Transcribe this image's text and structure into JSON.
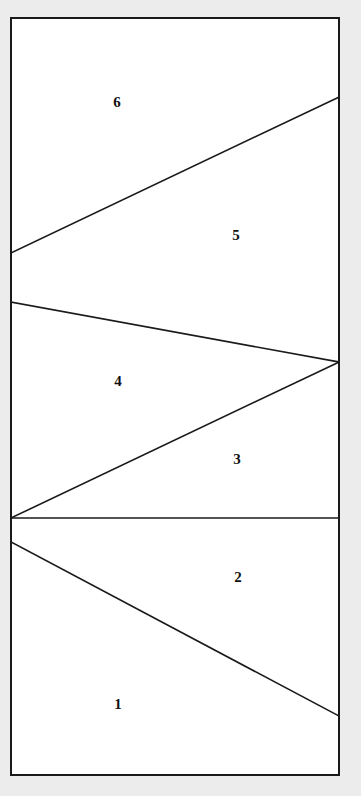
{
  "figure": {
    "name": "partitioned-rectangle",
    "background_color": "#ececec",
    "canvas": {
      "width": 361,
      "height": 796
    }
  },
  "frame": {
    "name": "outer-rectangle",
    "x": 11,
    "y": 18,
    "width": 328,
    "height": 757,
    "stroke_color": "#1a1a1a",
    "fill_color": "#ffffff",
    "stroke_width": 2
  },
  "partition_lines": [
    {
      "name": "line-6-5",
      "x1": 11,
      "y1": 253,
      "x2": 339,
      "y2": 97,
      "stroke_color": "#1a1a1a",
      "stroke_width": 1.6
    },
    {
      "name": "line-5-4",
      "x1": 11,
      "y1": 302,
      "x2": 339,
      "y2": 362,
      "stroke_color": "#1a1a1a",
      "stroke_width": 1.6
    },
    {
      "name": "line-4-3",
      "x1": 11,
      "y1": 518,
      "x2": 339,
      "y2": 362,
      "stroke_color": "#1a1a1a",
      "stroke_width": 1.6
    },
    {
      "name": "line-3-2",
      "x1": 11,
      "y1": 518,
      "x2": 339,
      "y2": 518,
      "stroke_color": "#1a1a1a",
      "stroke_width": 1.6
    },
    {
      "name": "line-2-1",
      "x1": 11,
      "y1": 542,
      "x2": 339,
      "y2": 716,
      "stroke_color": "#1a1a1a",
      "stroke_width": 1.6
    }
  ],
  "labels": [
    {
      "name": "region-label-6",
      "text": "6",
      "x": 117,
      "y": 104
    },
    {
      "name": "region-label-5",
      "text": "5",
      "x": 236,
      "y": 237
    },
    {
      "name": "region-label-4",
      "text": "4",
      "x": 118,
      "y": 383
    },
    {
      "name": "region-label-3",
      "text": "3",
      "x": 237,
      "y": 461
    },
    {
      "name": "region-label-2",
      "text": "2",
      "x": 238,
      "y": 579
    },
    {
      "name": "region-label-1",
      "text": "1",
      "x": 118,
      "y": 706
    }
  ]
}
